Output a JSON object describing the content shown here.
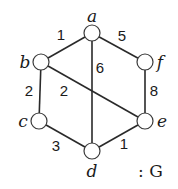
{
  "graph": {
    "name": "G",
    "caption": ": G",
    "nodes": [
      {
        "id": "a",
        "label": "a",
        "x": 92,
        "y": 33,
        "lx": 92,
        "ly": 22
      },
      {
        "id": "b",
        "label": "b",
        "x": 41,
        "y": 62,
        "lx": 25,
        "ly": 68
      },
      {
        "id": "c",
        "label": "c",
        "x": 39,
        "y": 121,
        "lx": 23,
        "ly": 127
      },
      {
        "id": "d",
        "label": "d",
        "x": 92,
        "y": 151,
        "lx": 92,
        "ly": 177
      },
      {
        "id": "e",
        "label": "e",
        "x": 145,
        "y": 121,
        "lx": 162,
        "ly": 127
      },
      {
        "id": "f",
        "label": "f",
        "x": 145,
        "y": 62,
        "lx": 160,
        "ly": 68
      }
    ],
    "edges": [
      {
        "from": "a",
        "to": "b",
        "weight": "1",
        "wx": 61,
        "wy": 40
      },
      {
        "from": "a",
        "to": "f",
        "weight": "5",
        "wx": 122,
        "wy": 41
      },
      {
        "from": "a",
        "to": "d",
        "weight": "6",
        "wx": 100,
        "wy": 73
      },
      {
        "from": "b",
        "to": "c",
        "weight": "2",
        "wx": 29,
        "wy": 96
      },
      {
        "from": "b",
        "to": "e",
        "weight": "2",
        "wx": 64,
        "wy": 96
      },
      {
        "from": "f",
        "to": "e",
        "weight": "8",
        "wx": 154,
        "wy": 96
      },
      {
        "from": "c",
        "to": "d",
        "weight": "3",
        "wx": 56,
        "wy": 151
      },
      {
        "from": "d",
        "to": "e",
        "weight": "1",
        "wx": 124,
        "wy": 149
      }
    ],
    "node_radius": 8
  }
}
